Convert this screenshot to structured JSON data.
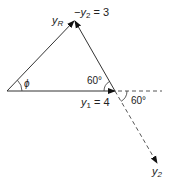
{
  "diagram": {
    "type": "vector-addition-triangle",
    "labels": {
      "resultant": "y",
      "resultant_sub": "R",
      "neg_y2_prefix": "−y",
      "neg_y2_sub": "2",
      "neg_y2_value": " = 3",
      "y1": "y",
      "y1_sub": "1",
      "y1_value": " = 4",
      "phi": "ϕ",
      "angle_inner": "60°",
      "angle_outer": "60°",
      "y2": "y",
      "y2_sub": "2"
    },
    "vectors": [
      {
        "name": "y1",
        "magnitude": 4,
        "direction_deg": 0,
        "style": "solid"
      },
      {
        "name": "-y2",
        "magnitude": 3,
        "direction_deg": 120,
        "style": "solid"
      },
      {
        "name": "y2",
        "magnitude": 3,
        "direction_deg": -60,
        "style": "dashed"
      },
      {
        "name": "yR",
        "style": "solid",
        "angle": "phi"
      }
    ]
  }
}
